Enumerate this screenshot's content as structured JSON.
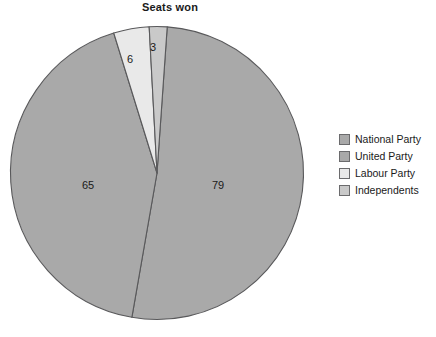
{
  "chart_data": {
    "type": "pie",
    "title": "Seats won",
    "xlabel": "",
    "ylabel": "",
    "categories": [
      "National Party",
      "United Party",
      "Labour Party",
      "Independents"
    ],
    "values": [
      79,
      65,
      6,
      3
    ],
    "data_labels": [
      "79",
      "65",
      "6",
      "3"
    ],
    "total": 153,
    "legend_position": "right",
    "grid": false,
    "start_angle_deg": 4,
    "direction": "clockwise",
    "colors": [
      "#a9a9a9",
      "#a9a9a9",
      "#e9e9e9",
      "#c9c9c9"
    ],
    "slice_border_color": "#59595b",
    "slices": [
      {
        "name": "National Party",
        "value": 79,
        "label": "79",
        "color": "#a9a9a9",
        "percent": "51.6",
        "sweep_deg": 185.9,
        "label_x": 218,
        "label_y": 186
      },
      {
        "name": "United Party",
        "value": 65,
        "label": "65",
        "color": "#a9a9a9",
        "percent": "42.5",
        "sweep_deg": 152.9,
        "label_x": 88,
        "label_y": 186
      },
      {
        "name": "Labour Party",
        "value": 6,
        "label": "6",
        "color": "#e9e9e9",
        "percent": "3.9",
        "sweep_deg": 14.1,
        "label_x": 130,
        "label_y": 60
      },
      {
        "name": "Independents",
        "value": 3,
        "label": "3",
        "color": "#c9c9c9",
        "percent": "2.0",
        "sweep_deg": 7.1,
        "label_x": 153,
        "label_y": 48
      }
    ]
  },
  "legend": {
    "items": [
      {
        "label": "National Party",
        "color": "#a9a9a9"
      },
      {
        "label": "United Party",
        "color": "#a9a9a9"
      },
      {
        "label": "Labour Party",
        "color": "#e9e9e9"
      },
      {
        "label": "Independents",
        "color": "#c9c9c9"
      }
    ]
  }
}
